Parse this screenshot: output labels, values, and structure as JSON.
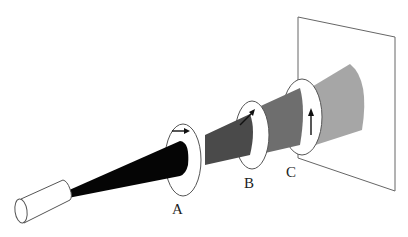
{
  "diagram": {
    "colors": {
      "background": "#ffffff",
      "outline": "#555555",
      "beam_segment_1": "#050505",
      "beam_segment_2": "#4a4a4a",
      "beam_segment_3": "#6e6e6e",
      "beam_segment_4": "#a6a6a6",
      "polarizer_fill": "#ffffff",
      "arrow": "#111111"
    },
    "source": {
      "name": "laser"
    },
    "polarizers": [
      {
        "id": "A",
        "label": "A",
        "arrow_direction": "horizontal"
      },
      {
        "id": "B",
        "label": "B",
        "arrow_direction": "diagonal-45"
      },
      {
        "id": "C",
        "label": "C",
        "arrow_direction": "vertical"
      }
    ],
    "screen": {
      "name": "screen"
    }
  }
}
